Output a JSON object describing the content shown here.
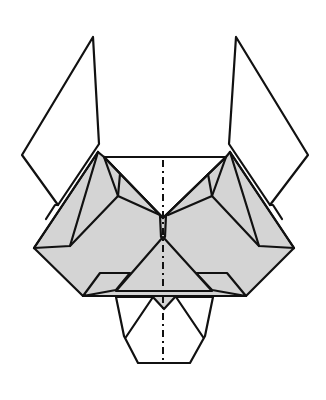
{
  "diagram": {
    "title": "",
    "colors": {
      "line": "#111111",
      "shaded_paper": "#d4d4d4",
      "white_paper": "#ffffff",
      "background": "#ffffff"
    },
    "elements": [
      {
        "name": "left-ear",
        "fill": "white"
      },
      {
        "name": "right-ear",
        "fill": "white"
      },
      {
        "name": "head-body",
        "fill": "shaded"
      },
      {
        "name": "center-triangle",
        "fill": "shaded"
      },
      {
        "name": "muzzle-pentagon",
        "fill": "white"
      },
      {
        "name": "center-fold-line",
        "style": "dash-dot"
      }
    ]
  }
}
